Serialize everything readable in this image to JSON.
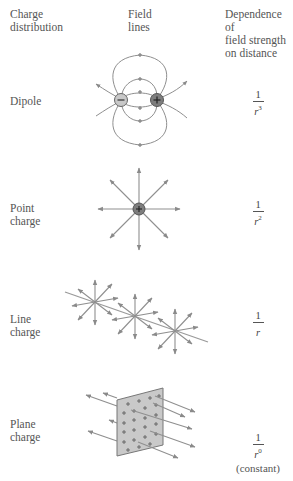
{
  "header": {
    "col1": [
      "Charge",
      "distribution"
    ],
    "col2": [
      "Field",
      "lines"
    ],
    "col3": [
      "Dependence of",
      "field strength",
      "on distance"
    ]
  },
  "rows": [
    {
      "label": [
        "Dipole"
      ],
      "numerator": "1",
      "base": "r",
      "exponent": "3"
    },
    {
      "label": [
        "Point",
        "charge"
      ],
      "numerator": "1",
      "base": "r",
      "exponent": "2"
    },
    {
      "label": [
        "Line",
        "charge"
      ],
      "numerator": "1",
      "base": "r",
      "exponent": ""
    },
    {
      "label": [
        "Plane",
        "charge"
      ],
      "numerator": "1",
      "base": "r",
      "exponent": "0",
      "note": "(constant)"
    }
  ],
  "symbols": {
    "positive": "+",
    "negative": "−"
  },
  "colors": {
    "line": "#8a8a8a",
    "positive_fill": "#7d7d7d",
    "negative_fill": "#c8c8c8",
    "plane_fill": "#c9c9c9"
  }
}
